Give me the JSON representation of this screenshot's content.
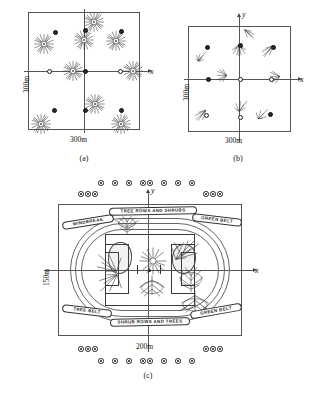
{
  "figure": {
    "title_visible": false,
    "panels": [
      {
        "id": "a",
        "caption": "(a)",
        "x_axis_label": "x",
        "y_axis_label": "",
        "width_label": "300m",
        "height_label": "300m",
        "description": "Square plot with nine tree starburst symbols arranged in a 3x3 pattern plus small scatterer dots",
        "tree_count": 9,
        "dot_count": 9
      },
      {
        "id": "b",
        "caption": "(b)",
        "x_axis_label": "x",
        "y_axis_label": "y",
        "width_label": "300m",
        "height_label": "300m",
        "description": "Square plot with nine grass-tuft symbols and nine scatterer dots",
        "tuft_count": 9,
        "dot_count": 9
      },
      {
        "id": "c",
        "caption": "(c)",
        "x_axis_label": "x",
        "y_axis_label": "y",
        "width_label": "200m",
        "height_label": "150m",
        "description": "Stadium plan view: rectangular boundary containing an oval running track, a central football pitch with goal boxes, tree clusters and outlined banner labels; rings of seat/lamp markers outside the boundary"
      }
    ],
    "panel_c_banner_labels": [
      "WINDBREAK",
      "TREE ROWS AND SHRUBS",
      "GREEN BELT",
      "TREE BELT",
      "SHRUB ROWS AND TREES",
      "GREEN BELT"
    ],
    "colors": {
      "ink": "#1a1a1a",
      "line": "#555555",
      "background": "#ffffff"
    }
  }
}
